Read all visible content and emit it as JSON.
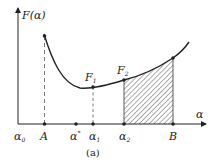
{
  "diagram": {
    "y_axis_label": "F(α)",
    "x_axis_label": "α",
    "caption": "(a)",
    "x_points": [
      {
        "name": "α0",
        "base": "α",
        "sub": "0"
      },
      {
        "name": "A",
        "base": "A",
        "sub": ""
      },
      {
        "name": "α*",
        "base": "α",
        "sub": "*"
      },
      {
        "name": "α1",
        "base": "α",
        "sub": "1"
      },
      {
        "name": "α2",
        "base": "α",
        "sub": "2"
      },
      {
        "name": "B",
        "base": "B",
        "sub": ""
      }
    ],
    "curve_points": [
      {
        "name": "F1",
        "base": "F",
        "sub": "1"
      },
      {
        "name": "F2",
        "base": "F",
        "sub": "2"
      }
    ],
    "shaded_region": "area under curve between α2 and B",
    "colors": {
      "line": "#222222",
      "hatch": "#333333",
      "background": "#ffffff"
    }
  }
}
